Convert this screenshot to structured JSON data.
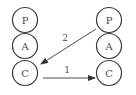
{
  "diagram": {
    "left_stack": {
      "nodes": [
        {
          "label": "P"
        },
        {
          "label": "A"
        },
        {
          "label": "C"
        }
      ]
    },
    "right_stack": {
      "nodes": [
        {
          "label": "P"
        },
        {
          "label": "A"
        },
        {
          "label": "C"
        }
      ]
    },
    "edges": [
      {
        "label": "1",
        "from": "left.C",
        "to": "right.C"
      },
      {
        "label": "2",
        "from": "right.P",
        "to": "left.C"
      }
    ],
    "colors": {
      "stroke": "#3a3a3a",
      "text": "#4a4a4a",
      "background": "#ffffff"
    }
  }
}
